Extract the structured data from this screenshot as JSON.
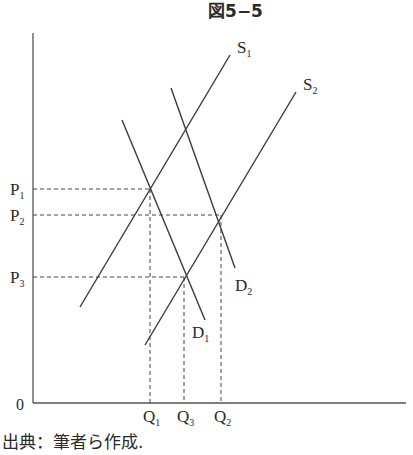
{
  "title": "図5−5",
  "caption": "出典：筆者ら作成.",
  "axes": {
    "origin_label": "0"
  },
  "curves": {
    "S1": {
      "label": "S",
      "sub": "1",
      "x1": 80,
      "y1": 307,
      "x2": 230,
      "y2": 55
    },
    "S2": {
      "label": "S",
      "sub": "2",
      "x1": 145,
      "y1": 345,
      "x2": 296,
      "y2": 92
    },
    "D1": {
      "label": "D",
      "sub": "1",
      "x1": 122,
      "y1": 120,
      "x2": 205,
      "y2": 320
    },
    "D2": {
      "label": "D",
      "sub": "2",
      "x1": 171,
      "y1": 88,
      "x2": 235,
      "y2": 268
    }
  },
  "price_levels": [
    {
      "label": "P",
      "sub": "1",
      "y": 189,
      "x_end": 150
    },
    {
      "label": "P",
      "sub": "2",
      "y": 215,
      "x_end": 221
    },
    {
      "label": "P",
      "sub": "3",
      "y": 277,
      "x_end": 184
    }
  ],
  "quantity_levels": [
    {
      "label": "Q",
      "sub": "1",
      "x": 150,
      "y_start": 189
    },
    {
      "label": "Q",
      "sub": "3",
      "x": 184,
      "y_start": 277
    },
    {
      "label": "Q",
      "sub": "2",
      "x": 221,
      "y_start": 215
    }
  ],
  "equilibria": [
    {
      "name": "E1",
      "curves": "S1∩D1",
      "price": "P1",
      "quantity": "Q1"
    },
    {
      "name": "E2",
      "curves": "S2∩D2",
      "price": "P2",
      "quantity": "Q2"
    },
    {
      "name": "E3",
      "curves": "S2∩D1",
      "price": "P3",
      "quantity": "Q3"
    }
  ],
  "colors": {
    "line": "#3a3a3a",
    "axis": "#555555",
    "text": "#2a2a2a"
  }
}
